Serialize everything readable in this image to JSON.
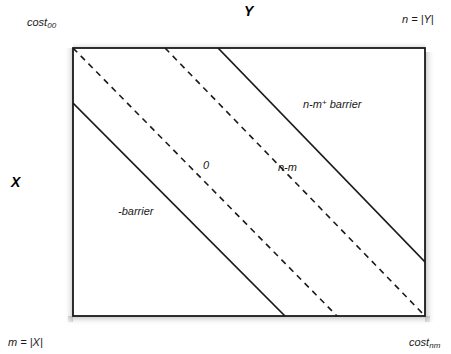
{
  "figure": {
    "axis_labels": {
      "y_top": "Y",
      "x_left": "X"
    },
    "corner_labels": {
      "top_left": "cost",
      "top_left_sub": "00",
      "top_right": "n = |Y|",
      "bottom_left": "m = |X|",
      "bottom_right": "cost",
      "bottom_right_sub": "nm"
    },
    "annotations": {
      "barrier": "-barrier",
      "zero": "0",
      "n_minus_m": "n-m",
      "n_minus_m_plus_barrier_pre": "n-m",
      "n_minus_m_plus_barrier_sup": "+",
      "n_minus_m_plus_barrier_post": " barrier"
    },
    "colors": {
      "line": "#1a1a1a",
      "box_border": "#1a1a1a",
      "background": "#ffffff",
      "text": "#1a1a1a",
      "shadow": "#b4b4b4"
    },
    "box": {
      "left": 73,
      "top": 48,
      "right": 425,
      "bottom": 316
    },
    "diagonals": [
      {
        "name": "zero-diagonal",
        "style": "dashed",
        "x1": 73,
        "y1": 48,
        "x2": 337,
        "y2": 316
      },
      {
        "name": "n-minus-m-diagonal",
        "style": "dashed",
        "x1": 165,
        "y1": 48,
        "x2": 425,
        "y2": 316
      },
      {
        "name": "n-minus-m-plus-barrier-diagonal",
        "style": "solid",
        "x1": 218,
        "y1": 48,
        "x2": 425,
        "y2": 262
      },
      {
        "name": "barrier-diagonal",
        "style": "solid",
        "x1": 73,
        "y1": 103,
        "x2": 285,
        "y2": 316
      }
    ]
  }
}
